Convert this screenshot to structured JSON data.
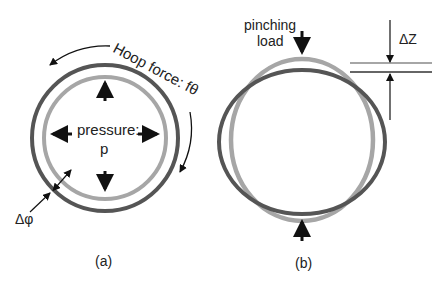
{
  "figure_a": {
    "caption": "(a)",
    "hoop_label": "Hoop force: fθ",
    "pressure_label": "pressure:",
    "pressure_symbol": "p",
    "thickness_label": "Δφ",
    "colors": {
      "outer_ring": "#555555",
      "inner_ring": "#a6a6a6",
      "arrows": "#111111"
    }
  },
  "figure_b": {
    "caption": "(b)",
    "load_label_line1": "pinching",
    "load_label_line2": "load",
    "displacement_label": "ΔZ",
    "colors": {
      "deformed_ring": "#555555",
      "original_ring": "#a6a6a6"
    }
  }
}
